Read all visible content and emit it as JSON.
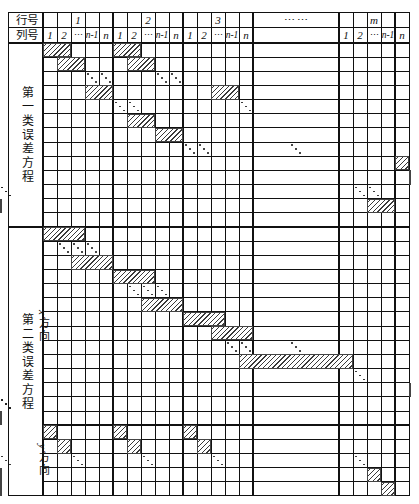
{
  "figure": {
    "kind": "sparse-matrix-structure-table",
    "description_labels": {
      "row_header_label": "行号",
      "col_header_label": "列号"
    }
  },
  "header": {
    "row_label": "行号",
    "col_label": "列号",
    "groups": [
      {
        "name": "1",
        "cols": [
          "1",
          "2",
          "⋯",
          "n-1",
          "n"
        ]
      },
      {
        "name": "2",
        "cols": [
          "1",
          "2",
          "⋯",
          "n-1",
          "n"
        ]
      },
      {
        "name": "3",
        "cols": [
          "1",
          "2",
          "⋯",
          "n-1",
          "n"
        ]
      },
      {
        "name": "⋯ ⋯",
        "cols": [
          ""
        ]
      },
      {
        "name": "m",
        "cols": [
          "1",
          "2",
          "⋯",
          "n-1",
          "n"
        ]
      }
    ],
    "ellipsis_group_label": "⋯ ⋯",
    "ellipsis_symbol": "⋯"
  },
  "sections": [
    {
      "id": "section-1",
      "label": "第一类误差方程",
      "label_en_hint": "first-kind-error-equations",
      "sub_sections": []
    },
    {
      "id": "section-2",
      "label": "第二类误差方程",
      "label_en_hint": "second-kind-error-equations",
      "sub_sections": [
        {
          "id": "sub-x",
          "label": "x 方向"
        },
        {
          "id": "sub-y",
          "label": "y 方向"
        }
      ]
    }
  ],
  "colors": {
    "grid_line": "#111111",
    "hatch_stroke": "#3a3a3a",
    "background": "#ffffff"
  },
  "grid": {
    "total_columns": 26,
    "column_width_px": 14.0,
    "row_height_px": 14.3,
    "note_columns": "5 cols per group x 3 groups, 1 wide ellipsis col, 5 cols for group m"
  },
  "chart_data": {
    "type": "heatmap",
    "title": "",
    "xlabel": "列号",
    "ylabel": "行号",
    "legend": [],
    "grid": true,
    "note": "Hatched cells mark non-zero blocks of a banded block-diagonal design matrix.",
    "section1_blocks": [
      {
        "row": 0,
        "col": 0,
        "span": 2
      },
      {
        "row": 0,
        "col": 5,
        "span": 2
      },
      {
        "row": 1,
        "col": 1,
        "span": 2
      },
      {
        "row": 1,
        "col": 6,
        "span": 2
      },
      {
        "row": 2,
        "ddots": [
          3,
          4,
          8,
          9
        ]
      },
      {
        "row": 3,
        "col": 3,
        "span": 2
      },
      {
        "row": 3,
        "col": 12,
        "span": 2
      },
      {
        "row": 4,
        "ddots": [
          5,
          6,
          14
        ]
      },
      {
        "row": 5,
        "col": 6,
        "span": 2
      },
      {
        "row": 6,
        "col": 8,
        "span": 2
      },
      {
        "row": 7,
        "ddots": [
          10,
          11,
          15
        ]
      },
      {
        "row": 8,
        "col": 20,
        "span": 2
      },
      {
        "row": 9,
        "col": 21,
        "span": 2
      },
      {
        "row": 10,
        "ddots": [
          17,
          18,
          22,
          23
        ]
      },
      {
        "row": 11,
        "col": 18,
        "span": 2
      },
      {
        "row": 11,
        "col": 23,
        "span": 2
      }
    ],
    "section2x_blocks": [
      {
        "row": 0,
        "col": 0,
        "span": 3
      },
      {
        "row": 1,
        "ddots": [
          1,
          2,
          3
        ]
      },
      {
        "row": 2,
        "col": 2,
        "span": 3
      },
      {
        "row": 3,
        "col": 5,
        "span": 3
      },
      {
        "row": 4,
        "ddots": [
          6,
          7,
          8
        ]
      },
      {
        "row": 5,
        "col": 7,
        "span": 3
      },
      {
        "row": 6,
        "col": 10,
        "span": 3
      },
      {
        "row": 7,
        "col": 12,
        "span": 3
      },
      {
        "row": 8,
        "ddots": [
          13,
          14,
          15
        ]
      },
      {
        "row": 9,
        "col": 14,
        "span": 3
      },
      {
        "row": 10,
        "ddots": [
          17
        ]
      },
      {
        "row": 11,
        "col": 21,
        "span": 3
      },
      {
        "row": 12,
        "ddots": [
          22,
          23,
          24
        ]
      },
      {
        "row": 13,
        "col": 23,
        "span": 3
      }
    ],
    "section2y_blocks": [
      {
        "row": 0,
        "col": 0,
        "span": 1
      },
      {
        "row": 0,
        "col": 5,
        "span": 1
      },
      {
        "row": 0,
        "col": 10,
        "span": 1
      },
      {
        "row": 1,
        "col": 1,
        "span": 1
      },
      {
        "row": 1,
        "col": 6,
        "span": 1
      },
      {
        "row": 1,
        "col": 11,
        "span": 1
      },
      {
        "row": 2,
        "ddots": [
          2,
          7,
          12,
          17,
          22
        ]
      },
      {
        "row": 3,
        "col": 18,
        "span": 1
      },
      {
        "row": 3,
        "col": 23,
        "span": 1
      },
      {
        "row": 4,
        "col": 19,
        "span": 1
      },
      {
        "row": 4,
        "col": 24,
        "span": 1
      }
    ]
  }
}
